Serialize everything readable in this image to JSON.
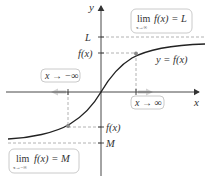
{
  "diagram": {
    "axes": {
      "x_label": "x",
      "y_label": "y"
    },
    "curve_label": "y = f(x)",
    "y_ticks": {
      "L": "L",
      "fx_upper": "f(x)",
      "fx_lower": "f(x)",
      "M": "M"
    },
    "approach_boxes": {
      "left": "x → −∞",
      "right": "x → ∞"
    },
    "limit_boxes": {
      "upper": {
        "lim": "lim",
        "sub": "x→∞",
        "expr": "f(x) = L"
      },
      "lower": {
        "lim": "lim",
        "sub": "x→−∞",
        "expr": "f(x) = M"
      }
    },
    "colors": {
      "curve": "#222222",
      "axes": "#333333",
      "dashed": "#9e9e9e",
      "arrow_hint": "#cfcfcf",
      "point": "#8a8a8a"
    }
  }
}
